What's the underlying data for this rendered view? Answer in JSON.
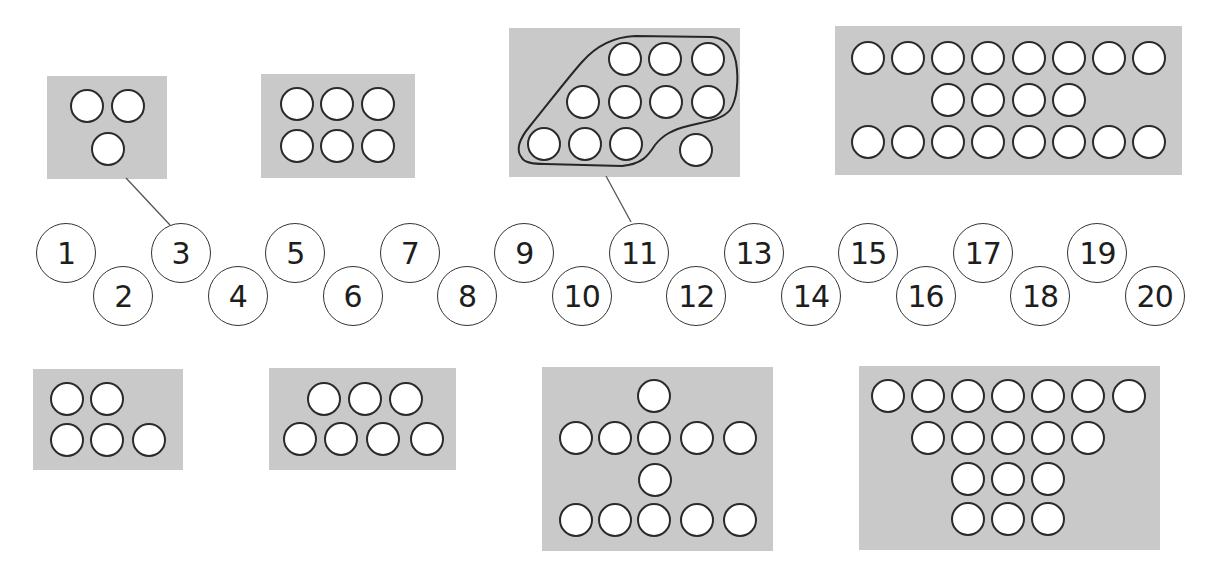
{
  "worksheet": {
    "number_line": {
      "labels": [
        "1",
        "2",
        "3",
        "4",
        "5",
        "6",
        "7",
        "8",
        "9",
        "10",
        "11",
        "12",
        "13",
        "14",
        "15",
        "16",
        "17",
        "18",
        "19",
        "20"
      ],
      "start_x": 66,
      "step_x": 57.3,
      "upper_y": 253,
      "lower_y": 296
    },
    "dot_boxes": [
      {
        "id": "box-3",
        "count": 3,
        "rows": [
          2,
          1
        ],
        "linked_to": "3",
        "rect": [
          47,
          76,
          120,
          103
        ],
        "dots": [
          [
            87,
            106
          ],
          [
            128,
            106
          ],
          [
            108,
            149
          ]
        ]
      },
      {
        "id": "box-6",
        "count": 6,
        "rows": [
          3,
          3
        ],
        "rect": [
          261,
          74,
          154,
          104
        ],
        "dots": [
          [
            297,
            104
          ],
          [
            337,
            104
          ],
          [
            378,
            104
          ],
          [
            297,
            146
          ],
          [
            337,
            146
          ],
          [
            378,
            146
          ]
        ]
      },
      {
        "id": "box-11",
        "count": 11,
        "rows": [
          3,
          4,
          3,
          1
        ],
        "linked_to": "11",
        "grouped_ten": true,
        "rect": [
          509,
          28,
          231,
          149
        ],
        "dots": [
          [
            625,
            59
          ],
          [
            665,
            59
          ],
          [
            708,
            59
          ],
          [
            583,
            102
          ],
          [
            625,
            102
          ],
          [
            666,
            102
          ],
          [
            708,
            102
          ],
          [
            544,
            144
          ],
          [
            585,
            144
          ],
          [
            626,
            144
          ],
          [
            696,
            150
          ]
        ]
      },
      {
        "id": "box-20",
        "count": 20,
        "rows": [
          8,
          4,
          8
        ],
        "rect": [
          835,
          26,
          347,
          149
        ],
        "dots": [
          [
            868,
            58
          ],
          [
            908,
            58
          ],
          [
            948,
            58
          ],
          [
            988,
            58
          ],
          [
            1029,
            58
          ],
          [
            1069,
            58
          ],
          [
            1109,
            58
          ],
          [
            1149,
            58
          ],
          [
            948,
            100
          ],
          [
            988,
            100
          ],
          [
            1029,
            100
          ],
          [
            1069,
            100
          ],
          [
            868,
            142
          ],
          [
            908,
            142
          ],
          [
            948,
            142
          ],
          [
            988,
            142
          ],
          [
            1029,
            142
          ],
          [
            1069,
            142
          ],
          [
            1109,
            142
          ],
          [
            1149,
            142
          ]
        ]
      },
      {
        "id": "box-5",
        "count": 5,
        "rows": [
          2,
          3
        ],
        "rect": [
          33,
          369,
          150,
          101
        ],
        "dots": [
          [
            67,
            399
          ],
          [
            107,
            399
          ],
          [
            67,
            440
          ],
          [
            107,
            440
          ],
          [
            149,
            440
          ]
        ]
      },
      {
        "id": "box-7",
        "count": 7,
        "rows": [
          3,
          4
        ],
        "rect": [
          269,
          368,
          187,
          102
        ],
        "dots": [
          [
            324,
            399
          ],
          [
            365,
            399
          ],
          [
            406,
            399
          ],
          [
            300,
            439
          ],
          [
            341,
            439
          ],
          [
            383,
            439
          ],
          [
            427,
            439
          ]
        ]
      },
      {
        "id": "box-12",
        "count": 12,
        "rows": [
          1,
          5,
          1,
          5
        ],
        "rect": [
          542,
          367,
          231,
          184
        ],
        "dots": [
          [
            654,
            396
          ],
          [
            576,
            438
          ],
          [
            615,
            438
          ],
          [
            654,
            438
          ],
          [
            697,
            438
          ],
          [
            740,
            438
          ],
          [
            655,
            480
          ],
          [
            576,
            520
          ],
          [
            615,
            520
          ],
          [
            654,
            520
          ],
          [
            697,
            520
          ],
          [
            740,
            520
          ]
        ]
      },
      {
        "id": "box-18",
        "count": 18,
        "rows": [
          7,
          5,
          3,
          3
        ],
        "rect": [
          859,
          366,
          301,
          184
        ],
        "dots": [
          [
            888,
            396
          ],
          [
            928,
            396
          ],
          [
            968,
            396
          ],
          [
            1008,
            396
          ],
          [
            1048,
            396
          ],
          [
            1088,
            396
          ],
          [
            1129,
            396
          ],
          [
            928,
            438
          ],
          [
            968,
            438
          ],
          [
            1008,
            438
          ],
          [
            1048,
            438
          ],
          [
            1088,
            438
          ],
          [
            968,
            479
          ],
          [
            1008,
            479
          ],
          [
            1048,
            479
          ],
          [
            968,
            519
          ],
          [
            1008,
            519
          ],
          [
            1048,
            519
          ]
        ]
      }
    ],
    "connectors": [
      {
        "from_box": "box-3",
        "to_number": "3",
        "x1": 126,
        "y1": 178,
        "x2": 170,
        "y2": 225
      },
      {
        "from_box": "box-11",
        "to_number": "11",
        "x1": 606,
        "y1": 176,
        "x2": 631,
        "y2": 222
      }
    ],
    "colors": {
      "box_fill": "#c9c9c9",
      "stroke": "#2a2a2a",
      "connector": "#555555"
    }
  }
}
